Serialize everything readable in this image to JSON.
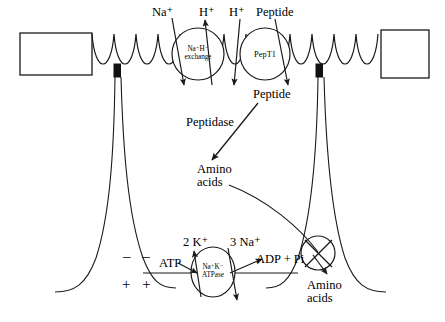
{
  "figure": {
    "type": "biological-cell-diagram",
    "colors": {
      "stroke": "#1a1a1a",
      "background": "#ffffff",
      "tight_junction": "#111111"
    }
  },
  "apical": {
    "transporters": [
      {
        "id": "nahe",
        "label_line1": "Na⁺H⁻",
        "label_line2": "exchange",
        "substrates_in": [
          "Na⁺"
        ],
        "substrates_out": [
          "H⁺"
        ]
      },
      {
        "id": "pept1",
        "label_line1": "PepT1",
        "label_line2": "",
        "substrates_in": [
          "H⁺",
          "Peptide"
        ],
        "substrates_out": []
      }
    ],
    "lumen_labels": [
      {
        "text": "Na⁺",
        "x": 155,
        "y": 8
      },
      {
        "text": "H⁺",
        "x": 201,
        "y": 8
      },
      {
        "text": "H⁺",
        "x": 231,
        "y": 8
      },
      {
        "text": "Peptide",
        "x": 254,
        "y": 8
      }
    ]
  },
  "cytoplasm": {
    "labels": [
      {
        "id": "peptide-intracellular",
        "text": "Peptide",
        "x": 254,
        "y": 89
      },
      {
        "id": "peptidase",
        "text": "Peptidase",
        "x": 189,
        "y": 118
      },
      {
        "id": "amino-acids-cytosol-line1",
        "text": "Amino",
        "x": 200,
        "y": 166
      },
      {
        "id": "amino-acids-cytosol-line2",
        "text": "acids",
        "x": 200,
        "y": 180
      }
    ]
  },
  "basolateral": {
    "pump": {
      "id": "na-k-atpase",
      "label_line1": "Na⁺K⁻",
      "label_line2": "ATPase"
    },
    "labels": [
      {
        "id": "k-out",
        "text": "2 K⁺",
        "x": 184,
        "y": 239
      },
      {
        "id": "na-out",
        "text": "3 Na⁺",
        "x": 232,
        "y": 239
      },
      {
        "id": "atp",
        "text": "ATP",
        "x": 161,
        "y": 260
      },
      {
        "id": "adp-pi",
        "text": "ADP + Pi",
        "x": 258,
        "y": 256
      },
      {
        "id": "amino-acids-serosa-line1",
        "text": "Amino",
        "x": 310,
        "y": 282
      },
      {
        "id": "amino-acids-serosa-line2",
        "text": "acids",
        "x": 310,
        "y": 296
      }
    ],
    "charges": {
      "negative": "– –",
      "positive": "+ +"
    },
    "amino_acid_transporter": {
      "id": "aa-carrier",
      "symbol": "crossed-circle"
    }
  }
}
